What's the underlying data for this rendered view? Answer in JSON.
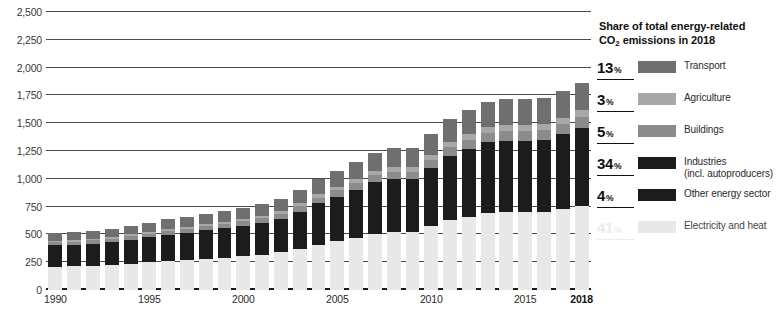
{
  "chart_data": {
    "type": "bar",
    "stacked": true,
    "title": "",
    "xlabel": "",
    "ylabel": "",
    "ylim": [
      0,
      2500
    ],
    "ytick_values": [
      0,
      250,
      500,
      750,
      1000,
      1250,
      1500,
      1750,
      2000,
      2250,
      2500
    ],
    "ytick_labels": [
      "0",
      "250",
      "500",
      "750",
      "1,000",
      "1,250",
      "1,500",
      "1,750",
      "2,000",
      "2,250",
      "2,500"
    ],
    "grid": true,
    "legend_position": "right",
    "x_axis_labeled_ticks": [
      "1990",
      "1995",
      "2000",
      "2005",
      "2010",
      "2015",
      "2018"
    ],
    "x_axis_bold_tick": "2018",
    "categories": [
      "1990",
      "1991",
      "1992",
      "1993",
      "1994",
      "1995",
      "1996",
      "1997",
      "1998",
      "1999",
      "2000",
      "2001",
      "2002",
      "2003",
      "2004",
      "2005",
      "2006",
      "2007",
      "2008",
      "2009",
      "2010",
      "2011",
      "2012",
      "2013",
      "2014",
      "2015",
      "2016",
      "2017",
      "2018"
    ],
    "series": [
      {
        "name": "Electricity and heat",
        "color": "#e8e8e6",
        "values": [
          210,
          215,
          220,
          228,
          238,
          250,
          262,
          272,
          283,
          292,
          305,
          318,
          338,
          370,
          408,
          440,
          470,
          505,
          520,
          520,
          572,
          628,
          660,
          692,
          700,
          700,
          705,
          730,
          760
        ]
      },
      {
        "name": "Other energy sector",
        "color": "#1c1c1c",
        "values": [
          22,
          22,
          22,
          23,
          24,
          25,
          26,
          27,
          28,
          29,
          30,
          31,
          33,
          36,
          40,
          43,
          46,
          49,
          51,
          51,
          56,
          61,
          64,
          67,
          68,
          68,
          69,
          71,
          74
        ]
      },
      {
        "name": "Industries (incl. autoproducers)",
        "color": "#1c1c1c",
        "values": [
          170,
          172,
          176,
          181,
          190,
          200,
          210,
          218,
          226,
          234,
          245,
          256,
          272,
          300,
          332,
          358,
          384,
          414,
          426,
          426,
          470,
          516,
          542,
          568,
          574,
          574,
          578,
          600,
          626
        ]
      },
      {
        "name": "Buildings",
        "color": "#8c8c8c",
        "values": [
          27,
          27,
          28,
          29,
          30,
          31,
          33,
          34,
          35,
          36,
          38,
          40,
          42,
          47,
          52,
          56,
          60,
          64,
          66,
          66,
          73,
          80,
          84,
          88,
          89,
          89,
          90,
          93,
          97
        ]
      },
      {
        "name": "Agriculture",
        "color": "#a8a8a6",
        "values": [
          16,
          16,
          17,
          17,
          18,
          19,
          20,
          20,
          21,
          22,
          23,
          24,
          25,
          28,
          31,
          34,
          36,
          39,
          40,
          40,
          44,
          48,
          51,
          53,
          54,
          54,
          54,
          56,
          58
        ]
      },
      {
        "name": "Transport",
        "color": "#6f6f6f",
        "values": [
          68,
          69,
          71,
          73,
          76,
          80,
          84,
          87,
          91,
          94,
          98,
          103,
          109,
          120,
          133,
          143,
          154,
          166,
          171,
          171,
          188,
          206,
          217,
          227,
          230,
          230,
          232,
          240,
          250
        ]
      }
    ],
    "totals": [
      513,
      521,
      534,
      551,
      576,
      605,
      635,
      658,
      684,
      707,
      739,
      772,
      819,
      901,
      996,
      1074,
      1150,
      1237,
      1274,
      1274,
      1403,
      1539,
      1618,
      1695,
      1715,
      1715,
      1728,
      1790,
      1865
    ],
    "bar_top_values": [
      520,
      530,
      545,
      560,
      585,
      615,
      645,
      670,
      695,
      720,
      750,
      785,
      835,
      915,
      1010,
      1090,
      1170,
      1255,
      1295,
      1295,
      1425,
      1560,
      1640,
      1720,
      1740,
      1740,
      1755,
      1815,
      1895
    ]
  },
  "legend": {
    "title_line1": "Share of total energy-related",
    "title_line2_pre": "CO",
    "title_line2_sub": "2",
    "title_line2_post": " emissions in 2018",
    "items": [
      {
        "percent": "13",
        "unit": "%",
        "label": "Transport",
        "label2": "",
        "color": "#6f6f6f",
        "faded": false
      },
      {
        "percent": "3",
        "unit": "%",
        "label": "Agriculture",
        "label2": "",
        "color": "#a8a8a6",
        "faded": false
      },
      {
        "percent": "5",
        "unit": "%",
        "label": "Buildings",
        "label2": "",
        "color": "#8c8c8c",
        "faded": false
      },
      {
        "percent": "34",
        "unit": "%",
        "label": "Industries",
        "label2": "(incl. autoproducers)",
        "color": "#1c1c1c",
        "faded": false
      },
      {
        "percent": "4",
        "unit": "%",
        "label": "Other energy sector",
        "label2": "",
        "color": "#1c1c1c",
        "faded": false
      },
      {
        "percent": "41",
        "unit": "%",
        "label": "Electricity and heat",
        "label2": "",
        "color": "#e8e8e6",
        "faded": true
      }
    ]
  }
}
